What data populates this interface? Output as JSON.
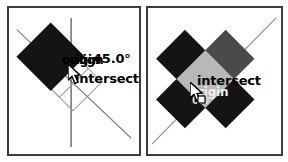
{
  "canvas": {
    "width": 288,
    "height": 162,
    "background": "#ffffff"
  },
  "colors": {
    "frame": "#3c3c3c",
    "shape_black": "#111111",
    "shape_dark_gray": "#4a4a4a",
    "shape_light_gray": "#b8b8b8",
    "outline_thin": "#8a8a8a",
    "guide_line": "#6e6e6e",
    "label_text": "#000000",
    "label_text_light": "#e8e8e8"
  },
  "panels": [
    {
      "id": "left",
      "name": "left-viewport",
      "shapes": [
        {
          "name": "filled-diamond",
          "fill": "#111111",
          "rotation_deg": 45,
          "center": [
            48,
            57
          ],
          "size": 52
        },
        {
          "name": "outline-diamond-lower",
          "fill": "none",
          "stroke": "#8a8a8a",
          "rotation_deg": 45,
          "center": [
            75,
            82
          ],
          "size": 48
        }
      ],
      "guides": [
        {
          "name": "vertical-axis",
          "from": [
            69,
            14
          ],
          "to": [
            69,
            147
          ]
        },
        {
          "name": "diagonal-45-line",
          "from": [
            14,
            27
          ],
          "to": [
            131,
            138
          ]
        }
      ],
      "labels": [
        {
          "name": "origin-label",
          "text": "origin"
        },
        {
          "name": "align-label",
          "text": "align"
        },
        {
          "name": "angle-label",
          "text": "45.0°"
        },
        {
          "name": "intersect-label",
          "text": "intersect"
        }
      ],
      "cursor": {
        "name": "arrow-cursor",
        "x": 68,
        "y": 64
      }
    },
    {
      "id": "right",
      "name": "right-viewport",
      "shapes": [
        {
          "name": "diamond-top-left",
          "fill": "#111111"
        },
        {
          "name": "diamond-top-right",
          "fill": "#4a4a4a"
        },
        {
          "name": "diamond-center",
          "fill": "#b8b8b8"
        },
        {
          "name": "diamond-bottom-left",
          "fill": "#111111"
        },
        {
          "name": "diamond-bottom-right",
          "fill": "#111111"
        }
      ],
      "guides": [
        {
          "name": "diagonal-45-line",
          "from": [
            8,
            142
          ],
          "to": [
            130,
            16
          ]
        }
      ],
      "labels": [
        {
          "name": "intersect-label",
          "text": "intersect"
        },
        {
          "name": "origin-label",
          "text": "origin"
        },
        {
          "name": "sub-label",
          "text": "0.0"
        }
      ],
      "cursor": {
        "name": "arrow-cursor",
        "x": 190,
        "y": 82
      }
    }
  ]
}
